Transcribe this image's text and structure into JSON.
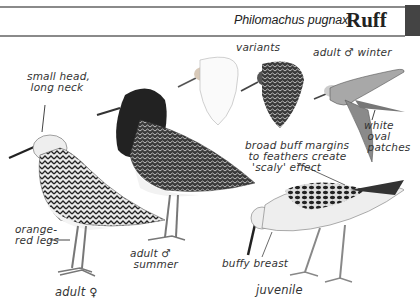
{
  "header": {
    "latin_name": "Philomachus pugnax",
    "common_name": "Ruff"
  },
  "labels": {
    "small_head": "small head,\n long neck",
    "variants": "variants",
    "adult_male_winter": "adult ♂ winter",
    "white_oval_patches": "white\n oval\n patches",
    "broad_buff": "broad buff margins\n to feathers create\n  'scaly' effect",
    "orange_red_legs": "orange-\nred legs",
    "adult_male_summer": "adult ♂\n summer",
    "adult_female": "adult ♀",
    "buffy_breast": "buffy breast",
    "juvenile": "juvenile"
  },
  "illustrations": [
    {
      "name": "adult female",
      "position": "left"
    },
    {
      "name": "adult male summer",
      "position": "center"
    },
    {
      "name": "variant head white",
      "position": "top center"
    },
    {
      "name": "variant head dark",
      "position": "top center-right"
    },
    {
      "name": "adult male winter in flight",
      "position": "top right"
    },
    {
      "name": "juvenile",
      "position": "bottom right"
    }
  ],
  "colors": {
    "rule": "#8a8a8a",
    "tab": "#444444",
    "ink": "#222222"
  }
}
